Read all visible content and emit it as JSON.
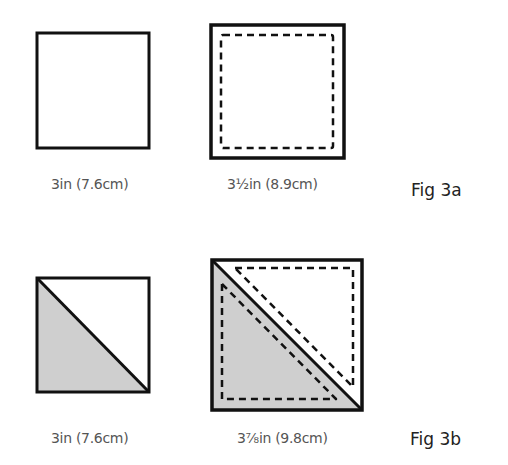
{
  "figures": [
    {
      "label": "Fig 3a",
      "items": [
        {
          "caption": "3in (7.6cm)",
          "shape": "plain-square"
        },
        {
          "caption": "3½in (8.9cm)",
          "shape": "square-with-dashed-seam"
        }
      ]
    },
    {
      "label": "Fig 3b",
      "items": [
        {
          "caption": "3in (7.6cm)",
          "shape": "half-square-triangle"
        },
        {
          "caption": "3⅞in (9.8cm)",
          "shape": "half-square-triangle-with-dashed-seams"
        }
      ]
    }
  ],
  "colors": {
    "line": "#111111",
    "shade": "#cfcfcf",
    "caption_text": "#555555",
    "label_text": "#222222"
  }
}
